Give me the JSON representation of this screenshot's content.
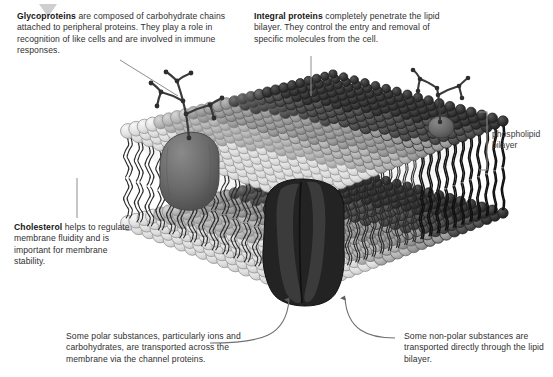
{
  "diagram": {
    "background_color": "#ffffff"
  },
  "callouts": [
    {
      "id": "glycoproteins",
      "term": "Glycoproteins",
      "text": " are composed of carbohydrate chains attached to peripheral proteins. They play a role in recognition of like cells and are involved in immune responses."
    },
    {
      "id": "integral-proteins",
      "term": "Integral proteins",
      "text": " completely penetrate the lipid bilayer. They control the entry and removal of specific molecules from the cell."
    },
    {
      "id": "cholesterol",
      "term": "Cholesterol",
      "text": " helps to regulate membrane fluidity and is important for membrane stability."
    },
    {
      "id": "polar-substances",
      "term": "",
      "text": "Some polar substances, particularly ions and carbohydrates, are transported across the membrane via the channel proteins."
    },
    {
      "id": "non-polar-substances",
      "term": "",
      "text": "Some non-polar substances are transported directly through the lipid bilayer."
    }
  ],
  "annotations": {
    "bilayer_label_line1": "phospholipid",
    "bilayer_label_line2": "bilayer"
  },
  "structures": {
    "phospholipid_head_icon": "circle-head",
    "phospholipid_tail_icon": "wavy-tail",
    "glycoprotein_icon": "branched-carbohydrate-chain",
    "integral_protein_icon": "channel-protein",
    "bracket_icon": "span-bracket",
    "arrow_icon": "curved-up-arrow",
    "triangle_icon": "down-triangle"
  },
  "colors": {
    "head_light": "#e2e2e2",
    "head_mid": "#b4b4b4",
    "head_dark": "#4a4a4a",
    "tail": "#1c1c1c",
    "glycoprotein_body": "#6d6d6d",
    "integral_protein": "#232323",
    "leader_line": "#8e8e8e",
    "text": "#2f2f2f",
    "triangle": "#cfcfcf"
  }
}
